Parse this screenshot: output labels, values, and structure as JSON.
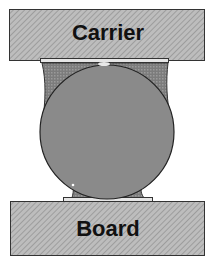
{
  "diagram": {
    "type": "solder-ball cross-section",
    "carrier": {
      "label": "Carrier",
      "fill": "#b5b5b5"
    },
    "board": {
      "label": "Board",
      "fill": "#b5b5b5"
    },
    "ball": {
      "fill": "#8a8a8a"
    },
    "solder_fillet": {
      "fill": "#7a7a7a"
    },
    "pad": {
      "fill": "#e6e6e6"
    }
  }
}
